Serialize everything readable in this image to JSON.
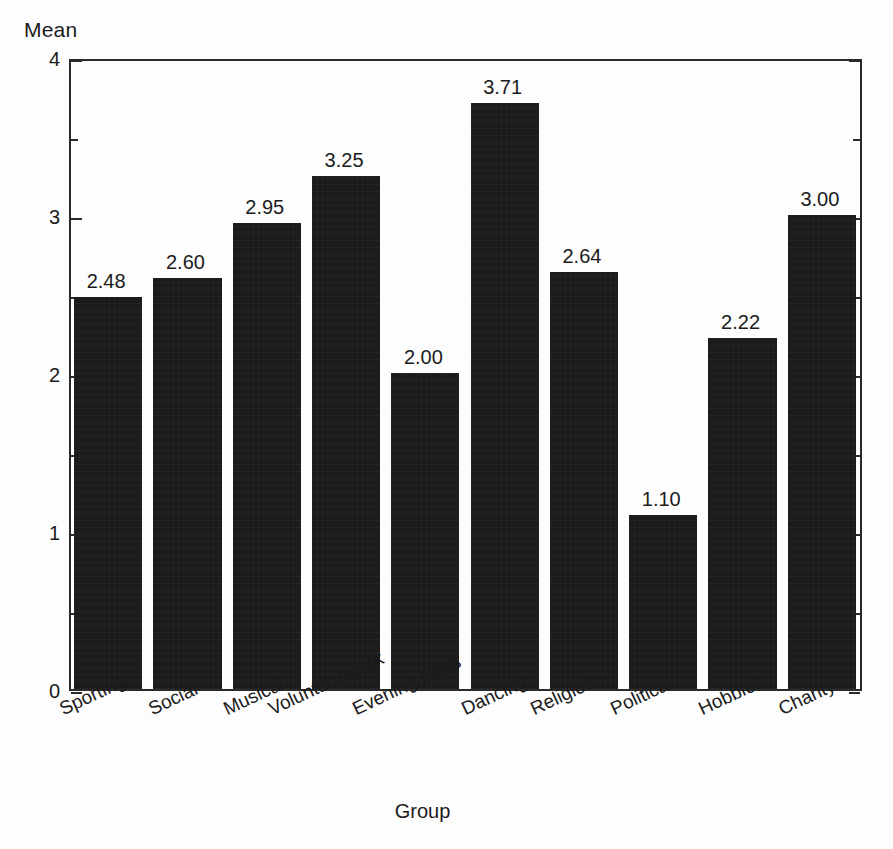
{
  "chart_data": {
    "type": "bar",
    "title": "",
    "xlabel": "Group",
    "ylabel": "Mean",
    "categories": [
      "Sporting",
      "Social",
      "Musical",
      "Voluntary work",
      "Evening class",
      "Dancing",
      "Religious",
      "Political",
      "Hobbies",
      "Charity"
    ],
    "values": [
      2.48,
      2.6,
      2.95,
      3.25,
      2.0,
      3.71,
      2.64,
      1.1,
      2.22,
      3.0
    ],
    "value_labels": [
      "2.48",
      "2.60",
      "2.95",
      "3.25",
      "2.00",
      "3.71",
      "2.64",
      "1.10",
      "2.22",
      "3.00"
    ],
    "ylim": [
      0,
      4
    ],
    "ytick_values": [
      0,
      1,
      2,
      3,
      4
    ],
    "ytick_labels": [
      "0",
      "1",
      "2",
      "3",
      "4"
    ],
    "yminor_values": [
      0.5,
      1.5,
      2.5,
      3.5
    ],
    "grid": false,
    "legend": null,
    "bar_color": "#1b1b1b",
    "frame_color": "#2a2a2a",
    "background_color": "#fdfdfd",
    "xtick_label_rotation_deg": -25
  },
  "axes": {
    "y_title": "Mean",
    "x_title": "Group"
  }
}
